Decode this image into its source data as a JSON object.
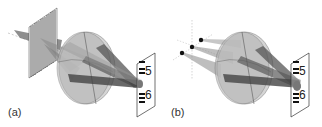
{
  "figure": {
    "panels": [
      {
        "id": "a",
        "label": "(a)",
        "source_type": "grating",
        "screen_labels": [
          "5",
          "6"
        ]
      },
      {
        "id": "b",
        "label": "(b)",
        "source_type": "point-sources",
        "screen_labels": [
          "5",
          "6"
        ]
      }
    ],
    "colors": {
      "lens_fill": "#b8b8b8",
      "beam": "#6a6a6a",
      "grating_lines": "#222222",
      "screen_border": "#333333",
      "point_source": "#111111"
    }
  }
}
